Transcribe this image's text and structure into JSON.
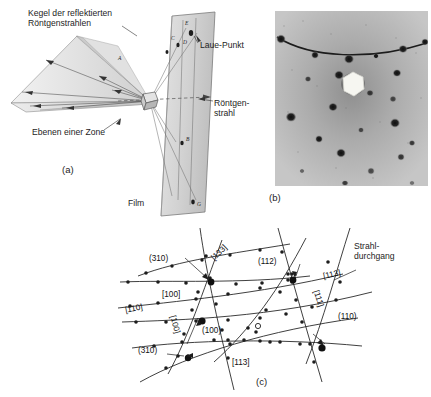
{
  "figure": {
    "kind": "laue-x-ray-diffraction-figure",
    "panels": [
      "a",
      "b",
      "c"
    ]
  },
  "panel_a": {
    "caption": "(a)",
    "labels": {
      "cone": "Kegel der reflektierten\nRöntgenstrahlen",
      "laue_point": "Laue-Punkt",
      "xray_beam": "Röntgen-\nstrahl",
      "zone_planes": "Ebenen einer Zone",
      "film": "Film"
    },
    "spot_marks": [
      "A",
      "B",
      "C",
      "D",
      "E",
      "F",
      "G"
    ]
  },
  "panel_b": {
    "caption": "(b)",
    "description": "laue-diffraction-photograph",
    "beam_stop": "white-hexagon-beamstop",
    "arc_spots": 6,
    "spots": 22
  },
  "panel_c": {
    "caption": "(c)",
    "labels": {
      "beam_passage": "Strahl-\ndurchgang"
    },
    "zone_indices": [
      {
        "text": "(310)",
        "id": "zone-310-top"
      },
      {
        "text": "[133]",
        "id": "zone-133"
      },
      {
        "text": "(112)",
        "id": "zone-112"
      },
      {
        "text": "[113]",
        "id": "zone-113-right"
      },
      {
        "text": "[111]",
        "id": "zone-111"
      },
      {
        "text": "(110)",
        "id": "zone-110"
      },
      {
        "text": "[100]",
        "id": "zone-100-upper"
      },
      {
        "text": "[110]",
        "id": "zone-110-left"
      },
      {
        "text": "[100]",
        "id": "zone-100-rot"
      },
      {
        "text": "(100)",
        "id": "zone-100-center"
      },
      {
        "text": "(310)",
        "id": "zone-310-low"
      },
      {
        "text": "[113]",
        "id": "zone-113-bottom"
      }
    ]
  },
  "colors": {
    "background": "#ffffff",
    "ink": "#1d1d1d",
    "photo_field": "#b9b9b9",
    "photo_spot": "#1b1b1b",
    "beamstop": "#f4f4ef",
    "shade_light": "#e9e9e9",
    "shade_mid": "#d4d4d4",
    "shade_dark": "#bdbdbd"
  }
}
